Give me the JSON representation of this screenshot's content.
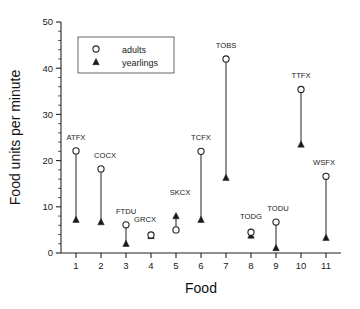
{
  "chart_data": {
    "type": "scatter",
    "title": "",
    "xlabel": "Food",
    "ylabel": "Food units per minute",
    "xlim": [
      0.4,
      11.6
    ],
    "ylim": [
      0,
      50
    ],
    "yticks": [
      0,
      10,
      20,
      30,
      40,
      50
    ],
    "ytick_minor_step": 2,
    "xticks": [
      1,
      2,
      3,
      4,
      5,
      6,
      7,
      8,
      9,
      10,
      11
    ],
    "grid": false,
    "legend_position": "upper-left",
    "categories": [
      1,
      2,
      3,
      4,
      5,
      6,
      7,
      8,
      9,
      10,
      11
    ],
    "point_labels": [
      "ATFX",
      "COCX",
      "FTDU",
      "GRCX",
      "SKCX",
      "TCFX",
      "TOBS",
      "TODG",
      "TODU",
      "TTFX",
      "WSFX"
    ],
    "series": [
      {
        "name": "adults",
        "marker": "open-circle",
        "values": [
          22.1,
          18.2,
          6.1,
          3.9,
          5.0,
          22.0,
          42.0,
          4.5,
          6.7,
          35.4,
          16.6
        ]
      },
      {
        "name": "yearlings",
        "marker": "filled-triangle",
        "values": [
          7.2,
          6.7,
          2.0,
          3.7,
          8.0,
          7.2,
          16.3,
          3.8,
          1.1,
          23.5,
          3.3
        ]
      }
    ],
    "connectors": true,
    "label_offsets": [
      {
        "dx": 0,
        "dy": -11
      },
      {
        "dx": 4,
        "dy": -11
      },
      {
        "dx": 0,
        "dy": -11
      },
      {
        "dx": -6,
        "dy": -13
      },
      {
        "dx": 4,
        "dy": -21
      },
      {
        "dx": 0,
        "dy": -11
      },
      {
        "dx": 0,
        "dy": -11
      },
      {
        "dx": 0,
        "dy": -13
      },
      {
        "dx": 2,
        "dy": -11
      },
      {
        "dx": 0,
        "dy": -11
      },
      {
        "dx": -2,
        "dy": -11
      }
    ]
  },
  "legend": {
    "entries": [
      {
        "label": "adults",
        "marker": "open-circle"
      },
      {
        "label": "yearlings",
        "marker": "filled-triangle"
      }
    ]
  },
  "colors": {
    "ink": "#1a1a1a",
    "axis": "#222222",
    "background": "#ffffff",
    "marker_fill_adult": "#ffffff",
    "marker_fill_yearling": "#1a1a1a"
  }
}
